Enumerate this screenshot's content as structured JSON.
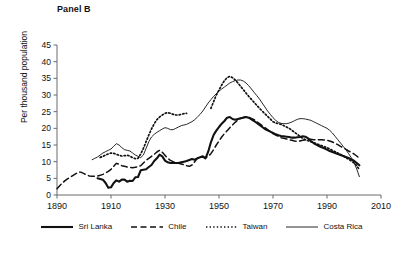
{
  "panel": {
    "title": "Panel B"
  },
  "axes": {
    "ylabel": "Per thousand population",
    "yticks": [
      0,
      5,
      10,
      15,
      20,
      25,
      30,
      35,
      40,
      45
    ],
    "xticks": [
      1890,
      1910,
      1930,
      1950,
      1970,
      1990,
      2010
    ]
  },
  "legend": {
    "items": [
      {
        "label": "Sri Lanka",
        "style": "solid-thick",
        "color": "#111111"
      },
      {
        "label": "Chile",
        "style": "dashed",
        "color": "#111111"
      },
      {
        "label": "Taiwan",
        "style": "dotted",
        "color": "#111111"
      },
      {
        "label": "Costa Rica",
        "style": "solid-thin",
        "color": "#111111"
      }
    ]
  },
  "chart_data": {
    "type": "line",
    "title": "Panel B",
    "xlabel": "",
    "ylabel": "Per thousand population",
    "xlim": [
      1890,
      2010
    ],
    "ylim": [
      0,
      45
    ],
    "xticks": [
      1890,
      1910,
      1930,
      1950,
      1970,
      1990,
      2010
    ],
    "yticks": [
      0,
      5,
      10,
      15,
      20,
      25,
      30,
      35,
      40,
      45
    ],
    "grid": false,
    "legend_position": "bottom",
    "series": [
      {
        "name": "Sri Lanka",
        "style": "solid-thick",
        "x": [
          1905,
          1907,
          1908,
          1909,
          1910,
          1911,
          1912,
          1913,
          1914,
          1915,
          1916,
          1917,
          1918,
          1919,
          1920,
          1921,
          1922,
          1923,
          1924,
          1925,
          1926,
          1927,
          1928,
          1929,
          1930,
          1931,
          1932,
          1933,
          1934,
          1935,
          1936,
          1937,
          1938,
          1939,
          1940,
          1941,
          1942,
          1943,
          1944,
          1945,
          1946,
          1947,
          1948,
          1949,
          1950,
          1951,
          1952,
          1953,
          1954,
          1955,
          1956,
          1957,
          1958,
          1959,
          1960,
          1961,
          1962,
          1963,
          1964,
          1965,
          1966,
          1967,
          1968,
          1969,
          1970,
          1971,
          1972,
          1973,
          1974,
          1975,
          1976,
          1977,
          1978,
          1979,
          1980,
          1981,
          1982,
          1983,
          1984,
          1985,
          1986,
          1987,
          1988,
          1989,
          1990,
          1991,
          1992,
          1993,
          1994,
          1995,
          1996,
          1997,
          1998,
          1999,
          2000,
          2001,
          2002
        ],
        "y": [
          5.0,
          4.6,
          3.6,
          2.2,
          2.3,
          3.6,
          4.4,
          4.0,
          4.6,
          4.6,
          4.0,
          4.3,
          4.2,
          5.3,
          5.4,
          7.4,
          7.6,
          7.7,
          8.4,
          9.0,
          10.2,
          11.0,
          12.1,
          11.6,
          10.3,
          9.8,
          9.6,
          9.6,
          9.6,
          9.6,
          9.8,
          10.0,
          10.2,
          10.5,
          10.8,
          10.6,
          11.0,
          11.3,
          11.6,
          11.0,
          13.0,
          15.8,
          18.0,
          19.3,
          20.4,
          21.4,
          22.2,
          23.2,
          23.4,
          22.8,
          22.6,
          22.8,
          23.0,
          23.2,
          23.4,
          23.2,
          22.7,
          22.2,
          21.6,
          21.0,
          20.4,
          19.8,
          19.4,
          19.0,
          18.6,
          18.2,
          17.9,
          17.7,
          17.6,
          17.5,
          17.4,
          17.2,
          17.2,
          17.3,
          17.4,
          17.6,
          17.5,
          17.0,
          16.2,
          15.6,
          15.1,
          14.7,
          14.3,
          14.0,
          13.6,
          13.2,
          12.9,
          12.6,
          12.3,
          12.0,
          11.7,
          11.4,
          11.1,
          10.7,
          10.3,
          9.6,
          8.9
        ]
      },
      {
        "name": "Chile",
        "style": "dashed",
        "x": [
          1890,
          1891,
          1892,
          1893,
          1894,
          1895,
          1896,
          1897,
          1898,
          1899,
          1900,
          1901,
          1902,
          1903,
          1904,
          1905,
          1906,
          1907,
          1908,
          1909,
          1910,
          1911,
          1912,
          1913,
          1914,
          1915,
          1916,
          1917,
          1918,
          1919,
          1920,
          1921,
          1922,
          1923,
          1924,
          1925,
          1926,
          1927,
          1928,
          1929,
          1930,
          1931,
          1932,
          1933,
          1934,
          1935,
          1936,
          1937,
          1938,
          1939,
          1940,
          1941,
          1942,
          1943,
          1944,
          1945,
          1946,
          1947,
          1948,
          1949,
          1950,
          1951,
          1952,
          1953,
          1954,
          1955,
          1956,
          1957,
          1958,
          1959,
          1960,
          1961,
          1962,
          1963,
          1964,
          1965,
          1966,
          1967,
          1968,
          1969,
          1970,
          1971,
          1972,
          1973,
          1974,
          1975,
          1976,
          1977,
          1978,
          1979,
          1980,
          1981,
          1982,
          1983,
          1984,
          1985,
          1986,
          1987,
          1988,
          1989,
          1990,
          1991,
          1992,
          1993,
          1994,
          1995,
          1996,
          1997,
          1998,
          1999,
          2000,
          2001,
          2002
        ],
        "y": [
          1.9,
          2.8,
          3.6,
          4.3,
          4.9,
          5.4,
          5.9,
          6.4,
          6.9,
          6.8,
          6.4,
          6.0,
          5.7,
          5.6,
          5.6,
          5.7,
          5.9,
          6.2,
          6.6,
          7.1,
          7.7,
          8.6,
          9.5,
          9.2,
          8.8,
          8.6,
          8.4,
          8.3,
          8.2,
          8.3,
          8.5,
          8.8,
          9.6,
          10.4,
          11.0,
          11.6,
          12.2,
          12.9,
          13.4,
          12.8,
          11.9,
          11.0,
          10.4,
          10.0,
          9.7,
          9.5,
          9.3,
          9.1,
          8.8,
          8.6,
          9.0,
          10.0,
          11.0,
          11.6,
          11.3,
          11.2,
          11.6,
          12.4,
          13.6,
          15.0,
          16.2,
          17.4,
          18.4,
          19.3,
          20.2,
          21.0,
          21.8,
          22.5,
          23.0,
          23.3,
          23.4,
          23.3,
          23.0,
          22.6,
          22.0,
          21.4,
          20.8,
          20.2,
          19.6,
          19.0,
          18.4,
          18.0,
          17.6,
          17.2,
          17.0,
          16.8,
          16.6,
          16.4,
          16.2,
          16.1,
          16.2,
          16.4,
          16.6,
          16.7,
          16.7,
          16.6,
          16.6,
          16.6,
          16.6,
          16.5,
          16.4,
          16.2,
          15.9,
          15.5,
          15.1,
          14.6,
          14.2,
          13.7,
          13.2,
          12.8,
          12.3,
          11.7,
          11.0
        ]
      },
      {
        "name": "Taiwan",
        "style": "dotted",
        "x": [
          1906,
          1907,
          1908,
          1909,
          1910,
          1911,
          1912,
          1913,
          1914,
          1915,
          1916,
          1917,
          1918,
          1919,
          1920,
          1921,
          1922,
          1923,
          1924,
          1925,
          1926,
          1927,
          1928,
          1929,
          1930,
          1931,
          1932,
          1933,
          1934,
          1935,
          1936,
          1937,
          1938,
          1947,
          1948,
          1949,
          1950,
          1951,
          1952,
          1953,
          1954,
          1955,
          1956,
          1957,
          1958,
          1959,
          1960,
          1961,
          1962,
          1963,
          1964,
          1965,
          1966,
          1967,
          1968,
          1969,
          1970,
          1971,
          1972,
          1973,
          1974,
          1975,
          1976,
          1977,
          1978,
          1979,
          1980,
          1981,
          1982,
          1983,
          1984,
          1985,
          1986,
          1987,
          1988,
          1989,
          1990,
          1991,
          1992,
          1993,
          1994,
          1995,
          1996,
          1997,
          1998,
          1999,
          2000,
          2001,
          2002
        ],
        "y": [
          11.3,
          11.6,
          12.0,
          12.3,
          12.6,
          12.5,
          12.2,
          11.9,
          11.7,
          11.8,
          11.9,
          11.7,
          11.2,
          10.9,
          11.0,
          12.3,
          14.0,
          16.0,
          18.0,
          19.8,
          21.4,
          22.6,
          23.4,
          24.0,
          24.5,
          24.7,
          24.5,
          24.2,
          24.0,
          24.0,
          24.2,
          24.4,
          24.5,
          26.0,
          28.0,
          30.0,
          31.5,
          33.0,
          34.3,
          35.2,
          35.6,
          35.2,
          34.5,
          33.6,
          32.6,
          31.6,
          30.6,
          29.6,
          28.7,
          27.8,
          26.9,
          26.0,
          25.2,
          24.4,
          23.6,
          22.8,
          22.0,
          21.6,
          21.4,
          21.2,
          20.8,
          20.4,
          20.0,
          19.4,
          18.8,
          18.2,
          17.6,
          17.0,
          16.6,
          16.3,
          16.0,
          15.7,
          15.4,
          15.1,
          14.8,
          14.5,
          14.2,
          13.8,
          13.4,
          13.0,
          12.6,
          12.2,
          11.7,
          11.2,
          10.7,
          10.2,
          9.6,
          8.8,
          7.6
        ]
      },
      {
        "name": "Costa Rica",
        "style": "solid-thin",
        "x": [
          1903,
          1904,
          1905,
          1906,
          1907,
          1908,
          1909,
          1910,
          1911,
          1912,
          1913,
          1914,
          1915,
          1916,
          1917,
          1918,
          1919,
          1920,
          1921,
          1922,
          1923,
          1924,
          1925,
          1926,
          1927,
          1928,
          1929,
          1930,
          1931,
          1932,
          1933,
          1934,
          1935,
          1936,
          1937,
          1938,
          1939,
          1940,
          1941,
          1942,
          1943,
          1944,
          1945,
          1946,
          1947,
          1948,
          1949,
          1950,
          1951,
          1952,
          1953,
          1954,
          1955,
          1956,
          1957,
          1958,
          1959,
          1960,
          1961,
          1962,
          1963,
          1964,
          1965,
          1966,
          1967,
          1968,
          1969,
          1970,
          1971,
          1972,
          1973,
          1974,
          1975,
          1976,
          1977,
          1978,
          1979,
          1980,
          1981,
          1982,
          1983,
          1984,
          1985,
          1986,
          1987,
          1988,
          1989,
          1990,
          1991,
          1992,
          1993,
          1994,
          1995,
          1996,
          1997,
          1998,
          1999,
          2000,
          2001,
          2002
        ],
        "y": [
          10.6,
          11.0,
          11.4,
          12.0,
          12.6,
          13.0,
          13.4,
          13.8,
          14.6,
          15.4,
          15.0,
          14.2,
          13.6,
          13.4,
          13.2,
          12.6,
          12.0,
          11.6,
          11.2,
          12.0,
          14.0,
          16.0,
          17.4,
          18.2,
          18.8,
          19.3,
          19.8,
          20.2,
          20.0,
          19.6,
          19.6,
          20.0,
          20.4,
          20.8,
          21.0,
          21.2,
          21.6,
          22.0,
          22.6,
          23.4,
          24.2,
          25.2,
          26.4,
          27.6,
          28.6,
          29.6,
          30.4,
          31.2,
          31.8,
          32.4,
          33.0,
          33.6,
          34.0,
          34.3,
          34.5,
          34.5,
          34.2,
          33.6,
          32.8,
          31.8,
          30.8,
          29.8,
          28.8,
          27.6,
          26.4,
          25.2,
          24.2,
          23.2,
          22.4,
          21.8,
          21.5,
          21.4,
          21.4,
          21.6,
          21.9,
          22.3,
          22.7,
          22.9,
          22.9,
          22.8,
          22.6,
          22.4,
          22.0,
          21.6,
          21.2,
          20.8,
          20.4,
          20.0,
          19.4,
          18.6,
          17.6,
          16.6,
          15.6,
          14.6,
          13.6,
          12.4,
          11.2,
          9.8,
          7.8,
          5.5
        ]
      }
    ]
  }
}
